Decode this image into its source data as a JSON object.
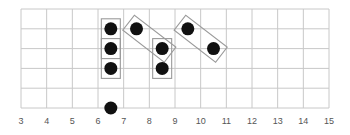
{
  "diagram": {
    "type": "grid-dot-pattern",
    "x_axis": {
      "min": 3,
      "max": 15,
      "ticks": [
        3,
        4,
        5,
        6,
        7,
        8,
        9,
        10,
        11,
        12,
        13,
        14,
        15
      ],
      "tick_labels": [
        "3",
        "4",
        "5",
        "6",
        "7",
        "8",
        "9",
        "10",
        "11",
        "12",
        "13",
        "14",
        "15"
      ]
    },
    "rows": 5,
    "grid_color": "#c8c8c8",
    "dot_color": "#111111",
    "box_color": "#9a9a9a",
    "dots": [
      {
        "x": 6.5,
        "row": 1
      },
      {
        "x": 6.5,
        "row": 2
      },
      {
        "x": 6.5,
        "row": 3
      },
      {
        "x": 6.5,
        "row": 5
      },
      {
        "x": 7.5,
        "row": 1
      },
      {
        "x": 8.5,
        "row": 2
      },
      {
        "x": 8.5,
        "row": 3
      },
      {
        "x": 9.5,
        "row": 1
      },
      {
        "x": 10.5,
        "row": 2
      }
    ],
    "groups": [
      {
        "kind": "vertical",
        "from": {
          "x": 6.5,
          "row": 1
        },
        "to": {
          "x": 6.5,
          "row": 2
        }
      },
      {
        "kind": "vertical",
        "from": {
          "x": 6.5,
          "row": 2
        },
        "to": {
          "x": 6.5,
          "row": 3
        }
      },
      {
        "kind": "diagonal",
        "from": {
          "x": 7.5,
          "row": 1
        },
        "to": {
          "x": 8.5,
          "row": 2
        }
      },
      {
        "kind": "vertical",
        "from": {
          "x": 8.5,
          "row": 2
        },
        "to": {
          "x": 8.5,
          "row": 3
        }
      },
      {
        "kind": "diagonal",
        "from": {
          "x": 9.5,
          "row": 1
        },
        "to": {
          "x": 10.5,
          "row": 2
        }
      }
    ]
  }
}
